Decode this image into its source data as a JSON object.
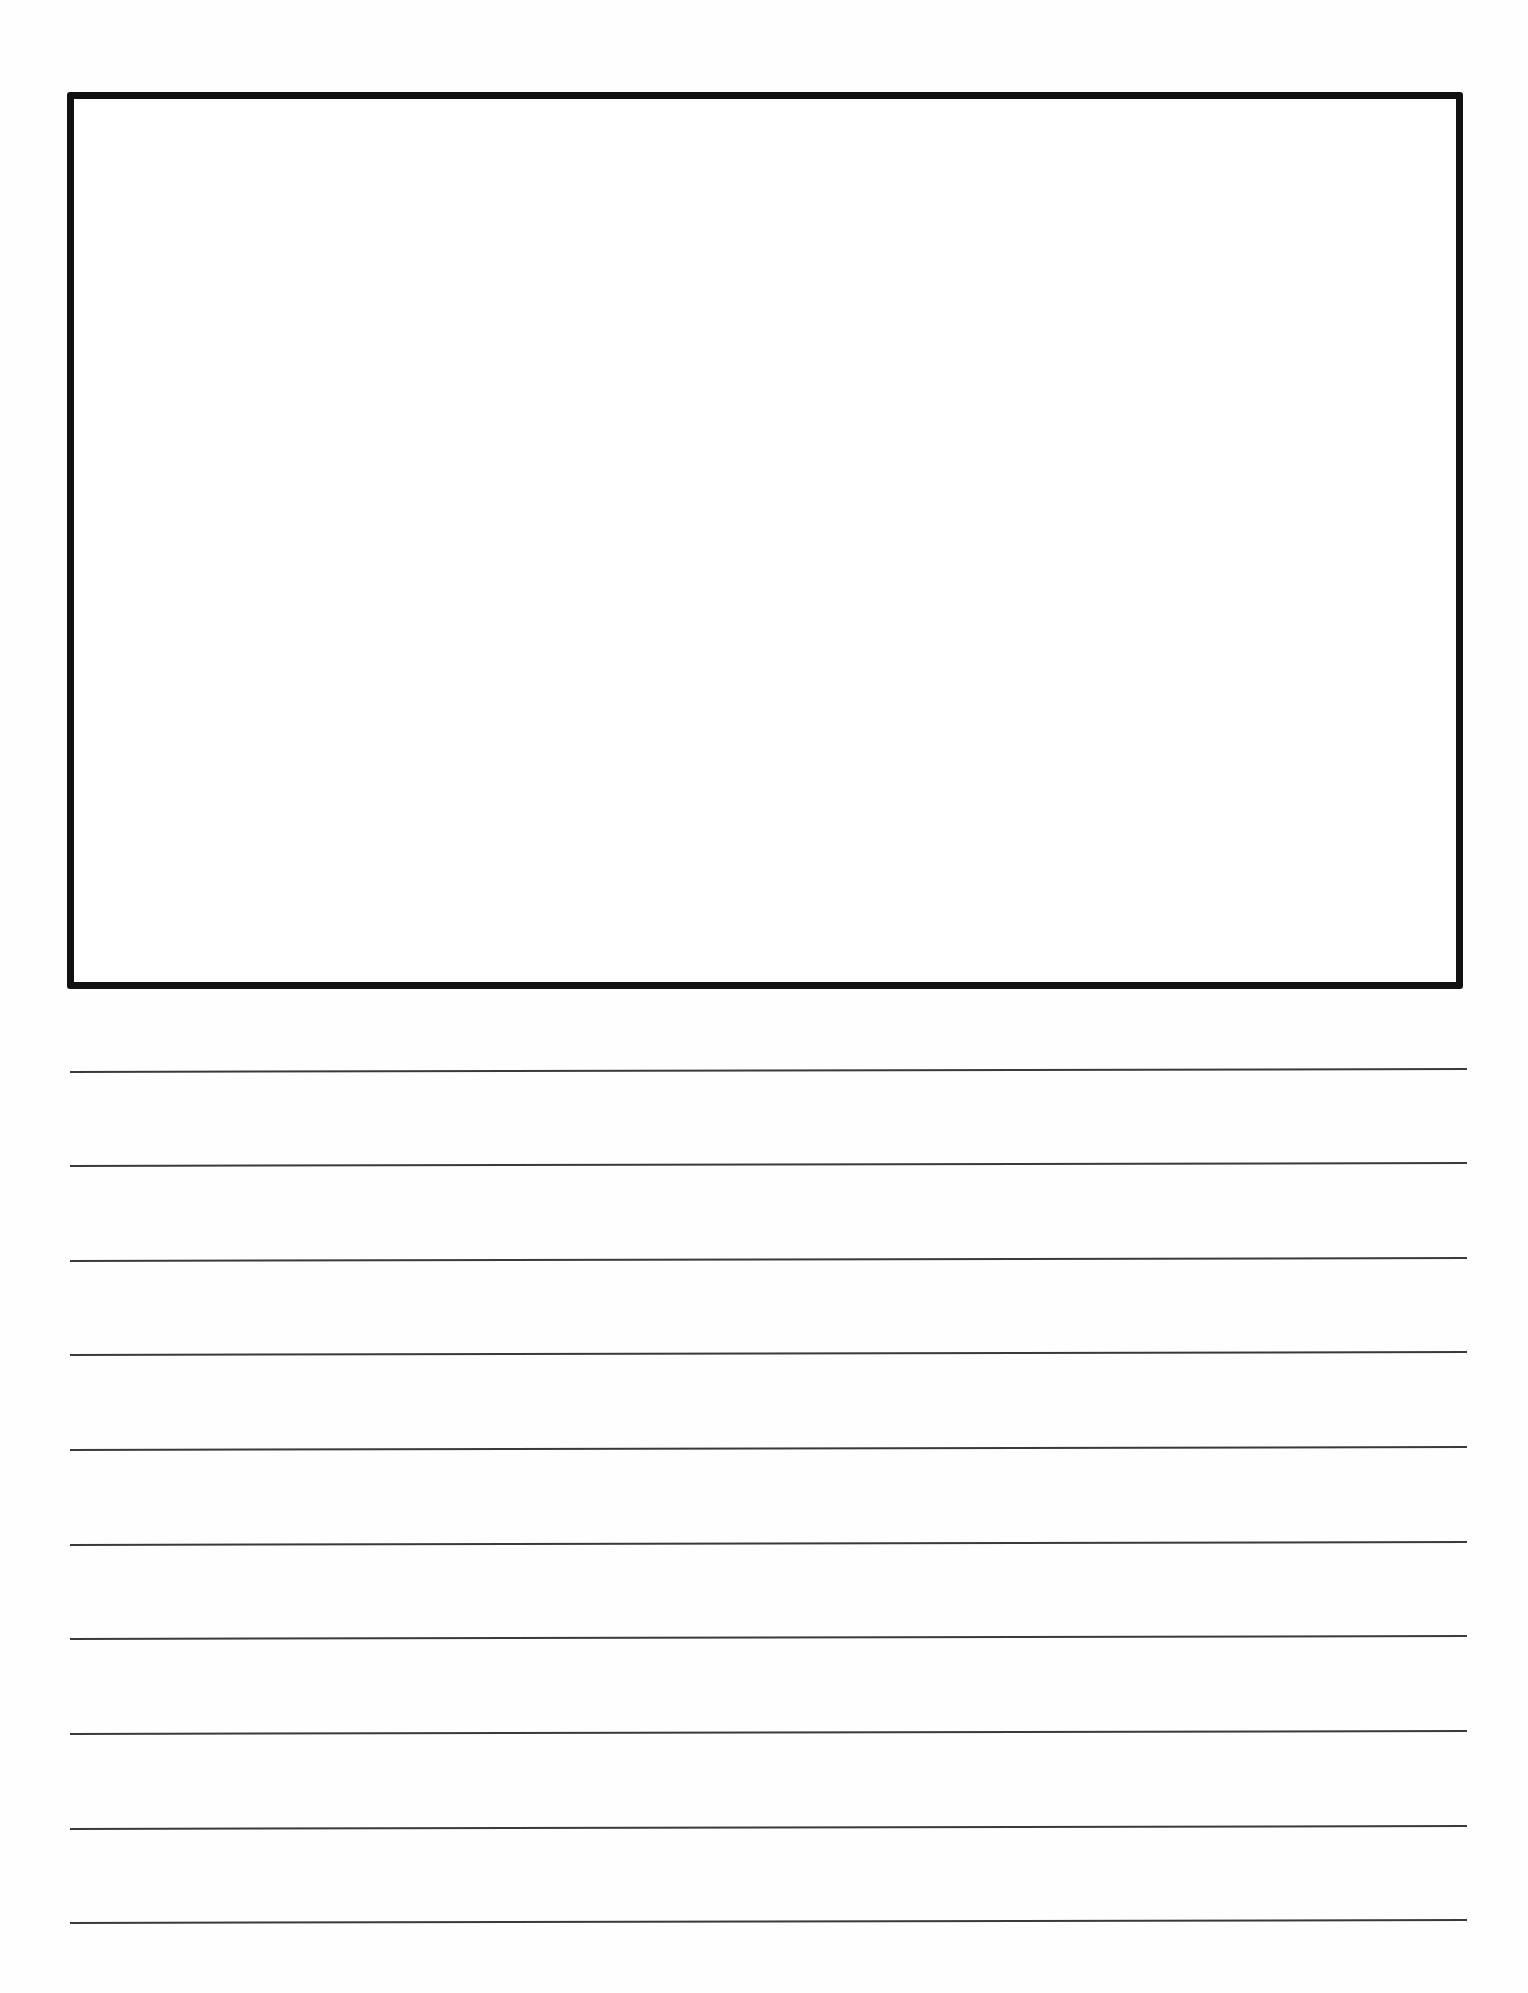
{
  "document": {
    "type": "primary-journal-writing-page",
    "drawing_box": {
      "label": "",
      "border_color": "#111111"
    },
    "writing_lines": {
      "count": 10,
      "color": "#3a3a3a",
      "positions_y": [
        1071,
        1165,
        1260,
        1354,
        1449,
        1544,
        1638,
        1733,
        1828,
        1922
      ]
    }
  }
}
